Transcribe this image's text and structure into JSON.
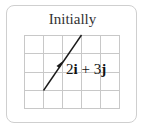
{
  "title": "Initially",
  "grid": {
    "columns": 5,
    "rows": 4,
    "line_color": "#c8c8c8"
  },
  "vector": {
    "label_coef_i": "2",
    "label_unit_i": "i",
    "label_op": " + ",
    "label_coef_j": "3",
    "label_unit_j": "j",
    "components": {
      "i": 2,
      "j": 3
    },
    "color": "#1a1a1a"
  },
  "card_border_color": "#cfcfcf"
}
